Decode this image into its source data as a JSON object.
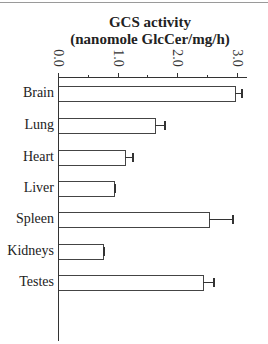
{
  "chart_data": {
    "type": "bar",
    "orientation": "horizontal",
    "title": "GCS activity",
    "subtitle": "(nanomole GlcCer/mg/h)",
    "xlabel": "GCS activity (nanomole GlcCer/mg/h)",
    "ylabel": "",
    "xlim": [
      0,
      3.0
    ],
    "x_ticks": [
      "0.0",
      "1.0",
      "2.0",
      "3.0"
    ],
    "axis_position": "top",
    "grid": false,
    "legend": null,
    "categories": [
      "Brain",
      "Lung",
      "Heart",
      "Liver",
      "Spleen",
      "Kidneys",
      "Testes"
    ],
    "values": [
      2.97,
      1.63,
      1.13,
      0.94,
      2.53,
      0.76,
      2.44
    ],
    "error": [
      0.12,
      0.17,
      0.13,
      0.02,
      0.4,
      0.02,
      0.17
    ]
  },
  "labels": {
    "title_line1": "GCS activity",
    "title_line2": "(nanomole GlcCer/mg/h)",
    "ticks": [
      "0.0",
      "1.0",
      "2.0",
      "3.0"
    ],
    "categories": [
      "Brain",
      "Lung",
      "Heart",
      "Liver",
      "Spleen",
      "Kidneys",
      "Testes"
    ]
  }
}
